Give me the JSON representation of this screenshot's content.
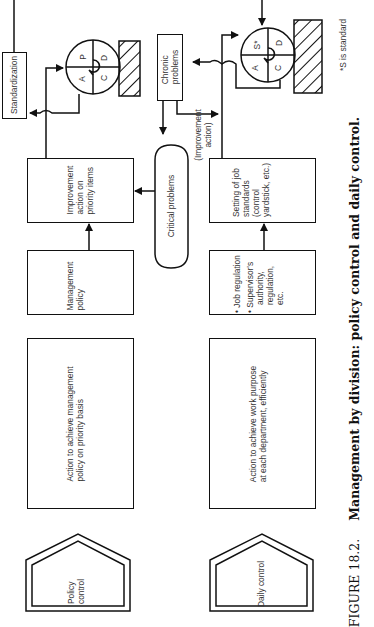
{
  "orientation": "rotated-90-ccw",
  "caption": {
    "label": "FIGURE 18.2.",
    "text": "Management by division: policy control and daily control."
  },
  "policy_row": {
    "header": "Policy control",
    "action_box": [
      "Action to achieve management",
      "policy on priority basis"
    ],
    "policy_box": [
      "Management",
      "policy"
    ],
    "improvement_box": [
      "Improvement",
      "action on",
      "priority items"
    ],
    "pdca": {
      "p": "P",
      "d": "D",
      "c": "C",
      "a": "A"
    },
    "standardization": "Standardization"
  },
  "middle": {
    "critical": "Critical problems",
    "chronic": [
      "Chronic",
      "problems"
    ],
    "improvement_action": [
      "(Improvement",
      "action)"
    ]
  },
  "daily_row": {
    "header": "Daily control",
    "action_box": [
      "Action to achieve work purpose",
      "at each department, efficiently"
    ],
    "regulation_box": {
      "item1": "Job regulation",
      "item2": [
        "Supervisor's",
        "authority,",
        "regulation,",
        "etc."
      ]
    },
    "standards_box": [
      "Setting of job",
      "standards",
      "(control",
      "yardstick, etc.)"
    ],
    "sdca": {
      "s": "S*",
      "d": "D",
      "c": "C",
      "a": "A"
    },
    "footnote": "*S is standard"
  }
}
